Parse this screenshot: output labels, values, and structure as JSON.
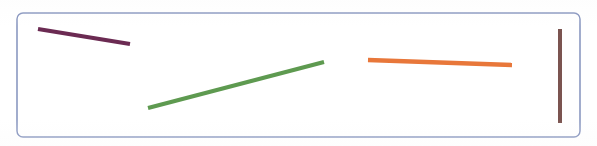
{
  "figure": {
    "width": 597,
    "height": 146,
    "background_color": "#ffffff",
    "frame": {
      "label": "panel-border",
      "x": 17,
      "y": 13,
      "width": 563,
      "height": 124,
      "corner_radius": 6,
      "stroke_color": "#7b8ab8",
      "stroke_width": 1.4,
      "fill_color": "#ffffff"
    }
  },
  "chart_data": {
    "type": "scatter",
    "title": "",
    "subtitle": "",
    "xlabel": "",
    "ylabel": "",
    "grid": false,
    "legend": "none",
    "axis_visible": false,
    "xlim": [
      0,
      597
    ],
    "ylim": [
      146,
      0
    ],
    "series": [
      {
        "name": "purple-segment",
        "color": "#6b2a52",
        "stroke_width": 4.2,
        "orientation": "descending",
        "x": [
          38,
          130
        ],
        "y": [
          29,
          44
        ],
        "length_px": 93,
        "angle_deg": 9.3
      },
      {
        "name": "green-segment",
        "color": "#5e9a50",
        "stroke_width": 4.2,
        "orientation": "ascending",
        "x": [
          148,
          324
        ],
        "y": [
          108,
          62
        ],
        "length_px": 182,
        "angle_deg": -14.7
      },
      {
        "name": "orange-segment",
        "color": "#e8773a",
        "stroke_width": 4.4,
        "orientation": "horizontal",
        "x": [
          368,
          512
        ],
        "y": [
          60,
          65
        ],
        "length_px": 144,
        "angle_deg": 2.0
      },
      {
        "name": "brown-segment",
        "color": "#7b5450",
        "stroke_width": 4.0,
        "orientation": "vertical",
        "x": [
          560,
          560
        ],
        "y": [
          29,
          123
        ],
        "length_px": 94,
        "angle_deg": 90.0
      }
    ]
  }
}
